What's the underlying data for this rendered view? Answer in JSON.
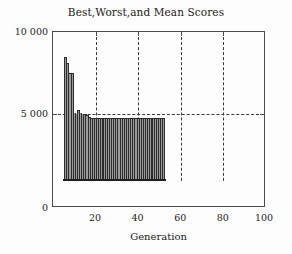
{
  "chart_data": {
    "type": "bar",
    "title": "Best,Worst,and Mean Scores",
    "xlabel": "Generation",
    "ylabel": "",
    "xlim": [
      0,
      100
    ],
    "ylim": [
      0,
      10000
    ],
    "xticks": [
      20,
      40,
      60,
      80,
      100
    ],
    "xtick_labels": [
      "20",
      "40",
      "60",
      "80",
      "100"
    ],
    "yticks": [
      0,
      5000,
      10000
    ],
    "ytick_labels": [
      "0",
      "5 000",
      "10 000"
    ],
    "grid": "dashed vertical at x ticks, dashed horizontal at y=5000",
    "legend": "none",
    "bar_color": "#2b2b2b",
    "bar_baseline": 1500,
    "x": [
      6,
      7,
      8,
      9,
      10,
      11,
      12,
      13,
      14,
      15,
      16,
      17,
      18,
      19,
      20,
      21,
      22,
      23,
      24,
      25,
      26,
      27,
      28,
      29,
      30,
      31,
      32,
      33,
      34,
      35,
      36,
      37,
      38,
      39,
      40,
      41,
      42,
      43,
      44,
      45,
      46,
      47,
      48,
      49,
      50,
      51,
      52
    ],
    "values": [
      8450,
      8100,
      7550,
      7550,
      5300,
      5250,
      5450,
      5300,
      5250,
      5200,
      5150,
      5050,
      5000,
      5000,
      5000,
      5000,
      5000,
      5000,
      5000,
      5000,
      5000,
      5000,
      5000,
      5000,
      5000,
      5000,
      5000,
      5000,
      5000,
      5000,
      5000,
      5000,
      5000,
      5000,
      5000,
      5000,
      5000,
      5000,
      5000,
      5000,
      5000,
      5000,
      5000,
      5000,
      5000,
      5000,
      5000
    ]
  },
  "axes": {
    "x_title": "Generation",
    "y_tick_0": "0",
    "y_tick_5000": "5 000",
    "y_tick_10000": "10 000",
    "x_tick_20": "20",
    "x_tick_40": "40",
    "x_tick_60": "60",
    "x_tick_80": "80",
    "x_tick_100": "100"
  }
}
